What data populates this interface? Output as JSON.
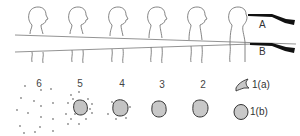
{
  "diagram": {
    "figures": [
      {
        "x": 38,
        "label": "figure-1"
      },
      {
        "x": 78,
        "label": "figure-2"
      },
      {
        "x": 118,
        "label": "figure-3"
      },
      {
        "x": 157,
        "label": "figure-4"
      },
      {
        "x": 197,
        "label": "figure-5"
      },
      {
        "x": 238,
        "label": "figure-6"
      }
    ],
    "shots": {
      "A": {
        "label": "A"
      },
      "B": {
        "label": "B"
      }
    },
    "patterns": [
      {
        "number": "6",
        "x": 38,
        "type": "dispersed-pellets"
      },
      {
        "number": "5",
        "x": 80,
        "type": "wound-with-heavy-stippling"
      },
      {
        "number": "4",
        "x": 121,
        "type": "wound-with-light-stippling"
      },
      {
        "number": "3",
        "x": 162,
        "type": "irregular-wound"
      },
      {
        "number": "2",
        "x": 203,
        "type": "round-wound"
      }
    ],
    "contact_patterns": [
      {
        "number": "1(a)",
        "type": "stellate-contact-wound"
      },
      {
        "number": "1(b)",
        "type": "round-contact-wound"
      }
    ],
    "colors": {
      "outline": "#555555",
      "wound_fill": "#c8c8c8",
      "wound_edge": "#333333",
      "gun": "#111111",
      "pellet": "#777777"
    }
  }
}
